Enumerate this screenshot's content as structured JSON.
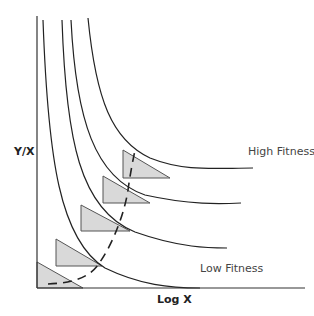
{
  "diagram": {
    "axes": {
      "y_label": "Y/X",
      "x_label": "Log X"
    },
    "annotations": {
      "high": "High Fitness",
      "low": "Low Fitness"
    },
    "colors": {
      "line": "#222222",
      "triangle_fill": "#d9d9d9",
      "triangle_stroke": "#555555"
    },
    "curves": [
      {
        "name": "fitness-curve-1",
        "path": "M43,20 C48,160 60,240 105,268 C140,285 170,288 200,288"
      },
      {
        "name": "fitness-curve-2",
        "path": "M62,20 C66,140 80,210 135,232 C180,248 210,248 227,248"
      },
      {
        "name": "fitness-curve-3",
        "path": "M71,20 C76,120 95,178 145,195 C190,205 220,204 241,203"
      },
      {
        "name": "fitness-curve-4",
        "path": "M88,18 C96,100 112,140 150,158 C185,172 215,168 253,168"
      }
    ],
    "triangles": [
      {
        "points": "37,262 37,288 83,288"
      },
      {
        "points": "56,239 56,266 102,266"
      },
      {
        "points": "81,205 81,231 130,231"
      },
      {
        "points": "103,176 103,203 150,203"
      },
      {
        "points": "123,150 123,178 170,178"
      }
    ],
    "dashed_path": "M48,284 C75,283 92,276 100,262 C115,240 125,210 128,190 C130,175 133,160 135,150"
  }
}
